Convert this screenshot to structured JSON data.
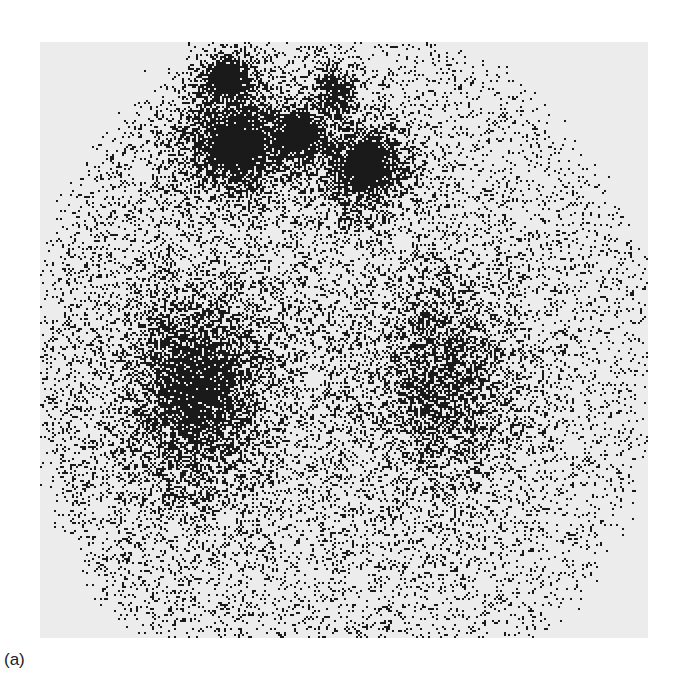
{
  "figure": {
    "caption": "(a)",
    "background_color": "#ececec",
    "dot_color": "#1a1a1a",
    "frame": {
      "x": 40,
      "y": 42,
      "width": 608,
      "height": 596
    },
    "body_outline": {
      "cx": 340,
      "cy": 370,
      "rx": 300,
      "ry": 330
    },
    "hotspots": [
      {
        "name": "upper-left-hot-region",
        "cx": 235,
        "cy": 145,
        "rx": 62,
        "ry": 55,
        "intensity": 1.0
      },
      {
        "name": "upper-left-top-lobe",
        "cx": 225,
        "cy": 75,
        "rx": 35,
        "ry": 30,
        "intensity": 0.95
      },
      {
        "name": "upper-right-hot-region",
        "cx": 365,
        "cy": 165,
        "rx": 50,
        "ry": 48,
        "intensity": 1.0
      },
      {
        "name": "upper-center-bridge",
        "cx": 300,
        "cy": 130,
        "rx": 30,
        "ry": 35,
        "intensity": 0.85
      },
      {
        "name": "upper-right-top-lobe",
        "cx": 335,
        "cy": 90,
        "rx": 25,
        "ry": 30,
        "intensity": 0.8
      },
      {
        "name": "lower-left-region",
        "cx": 195,
        "cy": 390,
        "rx": 75,
        "ry": 110,
        "intensity": 0.75
      },
      {
        "name": "lower-right-region",
        "cx": 445,
        "cy": 380,
        "rx": 75,
        "ry": 110,
        "intensity": 0.5
      }
    ]
  }
}
